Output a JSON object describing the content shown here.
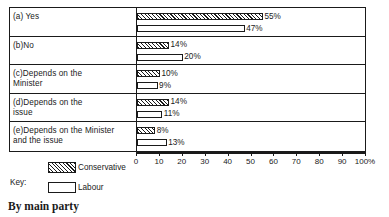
{
  "chart_data": {
    "type": "bar",
    "orientation": "horizontal",
    "title": "",
    "caption": "By main party",
    "xlabel": "",
    "ylabel": "",
    "xlim": [
      0,
      100
    ],
    "grid": false,
    "categories": [
      "(a) Yes",
      "(b)No",
      "(c)Depends on the\n     Minister",
      "(d)Depends on the\n     issue",
      "(e)Depends on the Minister\n     and the issue"
    ],
    "series": [
      {
        "name": "Conservative",
        "pattern": "diagonal-hatch",
        "values": [
          55,
          14,
          10,
          14,
          8
        ],
        "labels": [
          "55%",
          "14%",
          "10%",
          "14%",
          "8%"
        ]
      },
      {
        "name": "Labour",
        "pattern": "white-fill",
        "values": [
          47,
          20,
          9,
          11,
          13
        ],
        "labels": [
          "47%",
          "20%",
          "9%",
          "11%",
          "13%"
        ]
      }
    ],
    "x_ticks": [
      {
        "value": 0,
        "label": "0"
      },
      {
        "value": 10,
        "label": "10"
      },
      {
        "value": 20,
        "label": "20"
      },
      {
        "value": 30,
        "label": "30"
      },
      {
        "value": 40,
        "label": "40"
      },
      {
        "value": 50,
        "label": "50"
      },
      {
        "value": 60,
        "label": "60"
      },
      {
        "value": 70,
        "label": "70"
      },
      {
        "value": 80,
        "label": "80"
      },
      {
        "value": 90,
        "label": "90"
      },
      {
        "value": 100,
        "label": "100%"
      }
    ],
    "legend": {
      "title": "Key:",
      "position": "below-left",
      "entries": [
        {
          "label": "Conservative",
          "pattern": "diagonal-hatch"
        },
        {
          "label": "Labour",
          "pattern": "white-fill"
        }
      ]
    },
    "colors": {
      "ink": "#1a1a1a",
      "background": "#ffffff"
    }
  }
}
